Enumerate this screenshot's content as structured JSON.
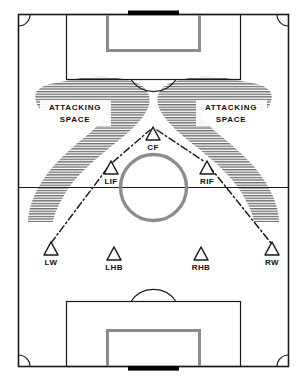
{
  "diagram": {
    "sport": "soccer",
    "view": "full pitch, vertical orientation"
  },
  "colors": {
    "line": "#1a1a1a",
    "goal_box": "#8c8c8c",
    "center_circle": "#8c8c8c",
    "goal_net": "#000000",
    "shading": "#6e6e6e",
    "background": "#ffffff",
    "text": "#111111"
  },
  "zones": [
    {
      "id": "attacking-space-left",
      "line1": "ATTACKING",
      "line2": "SPACE",
      "side": "left"
    },
    {
      "id": "attacking-space-right",
      "line1": "ATTACKING",
      "line2": "SPACE",
      "side": "right"
    }
  ],
  "players": [
    {
      "id": "cf",
      "label": "CF",
      "name": "Center Forward",
      "x": 153,
      "y": 134,
      "label_x": 153,
      "label_y": 146
    },
    {
      "id": "lif",
      "label": "LIF",
      "name": "Left Inside Forward",
      "x": 111,
      "y": 168,
      "label_x": 111,
      "label_y": 180
    },
    {
      "id": "rif",
      "label": "RIF",
      "name": "Right Inside Forward",
      "x": 207,
      "y": 168,
      "label_x": 207,
      "label_y": 180
    },
    {
      "id": "lw",
      "label": "LW",
      "name": "Left Wing",
      "x": 51,
      "y": 249,
      "label_x": 51,
      "label_y": 262
    },
    {
      "id": "lhb",
      "label": "LHB",
      "name": "Left Half Back",
      "x": 114,
      "y": 254,
      "label_x": 114,
      "label_y": 267
    },
    {
      "id": "rhb",
      "label": "RHB",
      "name": "Right Half Back",
      "x": 201,
      "y": 254,
      "label_x": 201,
      "label_y": 267
    },
    {
      "id": "rw",
      "label": "RW",
      "name": "Right Wing",
      "x": 272,
      "y": 249,
      "label_x": 272,
      "label_y": 262
    }
  ],
  "connections": [
    {
      "id": "lw-lif",
      "from": "lw",
      "to": "lif",
      "style": "dash-dot"
    },
    {
      "id": "lif-cf",
      "from": "lif",
      "to": "cf",
      "style": "dash-dot"
    },
    {
      "id": "cf-rif",
      "from": "cf",
      "to": "rif",
      "style": "dash-dot"
    },
    {
      "id": "rif-rw",
      "from": "rif",
      "to": "rw",
      "style": "dash-dot"
    }
  ],
  "field_markings": [
    {
      "id": "touchline-boundary",
      "shape": "rectangle"
    },
    {
      "id": "halfway-line",
      "shape": "line"
    },
    {
      "id": "center-circle",
      "shape": "circle"
    },
    {
      "id": "top-penalty-area",
      "shape": "rectangle"
    },
    {
      "id": "top-goal-area",
      "shape": "rectangle"
    },
    {
      "id": "top-penalty-arc",
      "shape": "arc"
    },
    {
      "id": "top-goal",
      "shape": "rectangle"
    },
    {
      "id": "bottom-penalty-area",
      "shape": "rectangle"
    },
    {
      "id": "bottom-goal-area",
      "shape": "rectangle"
    },
    {
      "id": "bottom-penalty-arc",
      "shape": "arc"
    },
    {
      "id": "bottom-goal",
      "shape": "rectangle"
    },
    {
      "id": "corner-arc-top-left",
      "shape": "arc"
    },
    {
      "id": "corner-arc-top-right",
      "shape": "arc"
    },
    {
      "id": "corner-arc-bottom-left",
      "shape": "arc"
    },
    {
      "id": "corner-arc-bottom-right",
      "shape": "arc"
    }
  ]
}
